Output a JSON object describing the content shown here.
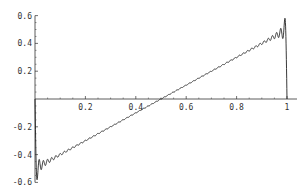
{
  "chart_data": {
    "type": "line",
    "title": "",
    "xlabel": "",
    "ylabel": "",
    "xlim": [
      0,
      1
    ],
    "ylim": [
      -0.6,
      0.6
    ],
    "grid": false,
    "legend": null,
    "x_ticks": [
      "0.2",
      "0.4",
      "0.6",
      "0.8",
      "1"
    ],
    "x_tick_values": [
      0.2,
      0.4,
      0.6,
      0.8,
      1
    ],
    "y_ticks": [
      "-0.6",
      "-0.4",
      "-0.2",
      "0.2",
      "0.4",
      "0.6"
    ],
    "y_tick_values": [
      -0.6,
      -0.4,
      -0.2,
      0.2,
      0.4,
      0.6
    ],
    "series": [
      {
        "name": "Fourier partial sum of sawtooth (x - 1/2)",
        "description": "Linear ramp from about -0.5 at x=0 to about 0.5 at x=1 with Gibbs-phenomenon ripples near the endpoints, overshooting to about -0.58 and +0.58",
        "x": [
          0,
          0.002,
          0.05,
          0.2,
          0.4,
          0.5,
          0.6,
          0.8,
          0.95,
          0.998,
          1
        ],
        "y": [
          0,
          -0.58,
          -0.45,
          -0.3,
          -0.1,
          0.0,
          0.1,
          0.3,
          0.45,
          0.58,
          0
        ],
        "color": "#222222"
      }
    ]
  },
  "axes": {
    "color": "#333333"
  }
}
